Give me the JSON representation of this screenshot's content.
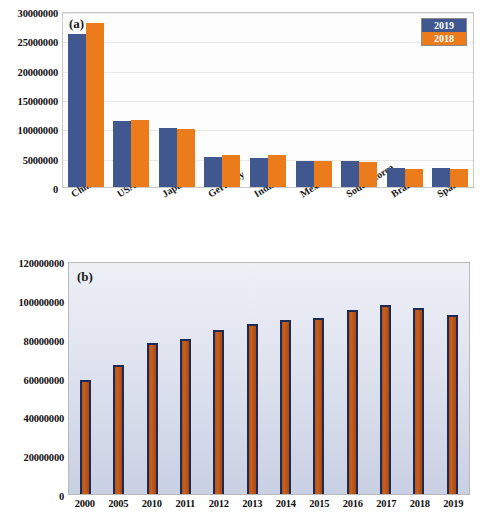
{
  "figure": {
    "panels": [
      {
        "id": "a",
        "label": "(a)",
        "legend": {
          "series_2019": "2019",
          "series_2018": "2018"
        }
      },
      {
        "id": "b",
        "label": "(b)"
      }
    ]
  },
  "colors": {
    "series_2019": "#40578f",
    "series_2018": "#ec7b1c",
    "panel_b_bar_fill": "#b3541a",
    "panel_b_bar_border": "#1d2a54",
    "panel_a_plot_bg": "#fdfdfd",
    "panel_b_plot_bg": "#dfe3ef",
    "gridline": "#e9e9e9"
  },
  "chart_data": [
    {
      "type": "bar",
      "title": "(a)",
      "xlabel": "",
      "ylabel": "",
      "ylim": [
        0,
        30000000
      ],
      "yticks": [
        0,
        5000000,
        10000000,
        15000000,
        20000000,
        25000000,
        30000000
      ],
      "ytick_labels": [
        "0",
        "5000000",
        "10000000",
        "15000000",
        "20000000",
        "25000000",
        "30000000"
      ],
      "grid": true,
      "legend_position": "top-right",
      "categories": [
        "China",
        "USA",
        "Japan",
        "Germany",
        "India",
        "Mexico",
        "South Korea",
        "Brazil",
        "Spain"
      ],
      "series": [
        {
          "name": "2019",
          "color": "#40578f",
          "values": [
            26000000,
            11300000,
            10050000,
            5100000,
            5000000,
            4400000,
            4400000,
            3300000,
            3200000
          ]
        },
        {
          "name": "2018",
          "color": "#ec7b1c",
          "values": [
            28000000,
            11500000,
            9950000,
            5400000,
            5450000,
            4400000,
            4250000,
            3050000,
            3000000
          ]
        }
      ]
    },
    {
      "type": "bar",
      "title": "(b)",
      "xlabel": "",
      "ylabel": "",
      "ylim": [
        0,
        120000000
      ],
      "yticks": [
        0,
        20000000,
        40000000,
        60000000,
        80000000,
        100000000,
        120000000
      ],
      "ytick_labels": [
        "0",
        "20000000",
        "40000000",
        "60000000",
        "80000000",
        "100000000",
        "120000000"
      ],
      "grid": false,
      "legend_position": "none",
      "categories": [
        "2000",
        "2005",
        "2010",
        "2011",
        "2012",
        "2013",
        "2014",
        "2015",
        "2016",
        "2017",
        "2018",
        "2019"
      ],
      "series": [
        {
          "name": "production",
          "color": "#b3541a",
          "values": [
            58500000,
            66500000,
            77800000,
            80000000,
            84500000,
            87800000,
            89800000,
            90700000,
            94800000,
            97200000,
            95800000,
            92000000
          ]
        }
      ]
    }
  ]
}
